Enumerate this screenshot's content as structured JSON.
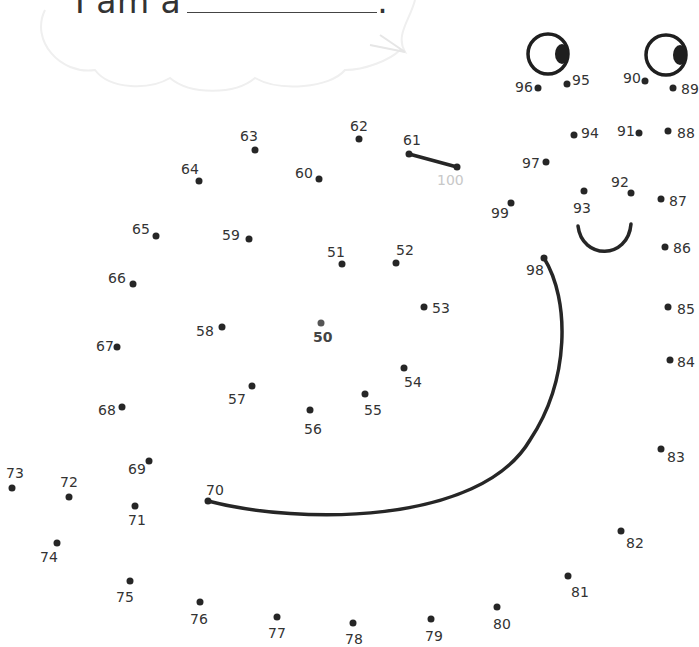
{
  "worksheet": {
    "prompt_text": "I am a",
    "prompt_end": ".",
    "start_label": "50",
    "end_label": "100",
    "colors": {
      "ink": "#262626",
      "label": "#333333",
      "end_label": "#c8c8c8",
      "bubble": "#f2f2f2"
    }
  },
  "dots": [
    {
      "n": "50",
      "x": 321,
      "y": 323,
      "lx": 313,
      "ly": 330,
      "cls": "start"
    },
    {
      "n": "51",
      "x": 342,
      "y": 264,
      "lx": 327,
      "ly": 245
    },
    {
      "n": "52",
      "x": 396,
      "y": 263,
      "lx": 396,
      "ly": 243
    },
    {
      "n": "53",
      "x": 424,
      "y": 307,
      "lx": 432,
      "ly": 301
    },
    {
      "n": "54",
      "x": 404,
      "y": 368,
      "lx": 404,
      "ly": 375
    },
    {
      "n": "55",
      "x": 365,
      "y": 394,
      "lx": 364,
      "ly": 403
    },
    {
      "n": "56",
      "x": 310,
      "y": 410,
      "lx": 304,
      "ly": 422
    },
    {
      "n": "57",
      "x": 252,
      "y": 386,
      "lx": 228,
      "ly": 392
    },
    {
      "n": "58",
      "x": 222,
      "y": 327,
      "lx": 196,
      "ly": 324
    },
    {
      "n": "59",
      "x": 249,
      "y": 239,
      "lx": 222,
      "ly": 228
    },
    {
      "n": "60",
      "x": 319,
      "y": 179,
      "lx": 295,
      "ly": 166
    },
    {
      "n": "61",
      "x": 409,
      "y": 154,
      "lx": 403,
      "ly": 133
    },
    {
      "n": "62",
      "x": 359,
      "y": 139,
      "lx": 350,
      "ly": 119
    },
    {
      "n": "63",
      "x": 255,
      "y": 150,
      "lx": 240,
      "ly": 129
    },
    {
      "n": "64",
      "x": 199,
      "y": 181,
      "lx": 181,
      "ly": 162
    },
    {
      "n": "65",
      "x": 156,
      "y": 236,
      "lx": 132,
      "ly": 222
    },
    {
      "n": "66",
      "x": 133,
      "y": 284,
      "lx": 108,
      "ly": 271
    },
    {
      "n": "67",
      "x": 117,
      "y": 347,
      "lx": 96,
      "ly": 339
    },
    {
      "n": "68",
      "x": 122,
      "y": 407,
      "lx": 98,
      "ly": 403
    },
    {
      "n": "69",
      "x": 149,
      "y": 461,
      "lx": 128,
      "ly": 462
    },
    {
      "n": "70",
      "x": 208,
      "y": 501,
      "lx": 206,
      "ly": 483
    },
    {
      "n": "71",
      "x": 135,
      "y": 506,
      "lx": 128,
      "ly": 513
    },
    {
      "n": "72",
      "x": 69,
      "y": 497,
      "lx": 60,
      "ly": 475
    },
    {
      "n": "73",
      "x": 12,
      "y": 488,
      "lx": 6,
      "ly": 466
    },
    {
      "n": "74",
      "x": 57,
      "y": 543,
      "lx": 40,
      "ly": 550
    },
    {
      "n": "75",
      "x": 130,
      "y": 581,
      "lx": 116,
      "ly": 590
    },
    {
      "n": "76",
      "x": 200,
      "y": 602,
      "lx": 190,
      "ly": 612
    },
    {
      "n": "77",
      "x": 277,
      "y": 617,
      "lx": 268,
      "ly": 626
    },
    {
      "n": "78",
      "x": 353,
      "y": 623,
      "lx": 345,
      "ly": 632
    },
    {
      "n": "79",
      "x": 431,
      "y": 619,
      "lx": 425,
      "ly": 629
    },
    {
      "n": "80",
      "x": 497,
      "y": 607,
      "lx": 493,
      "ly": 617
    },
    {
      "n": "81",
      "x": 568,
      "y": 576,
      "lx": 571,
      "ly": 585
    },
    {
      "n": "82",
      "x": 621,
      "y": 531,
      "lx": 626,
      "ly": 536
    },
    {
      "n": "83",
      "x": 661,
      "y": 449,
      "lx": 667,
      "ly": 450
    },
    {
      "n": "84",
      "x": 670,
      "y": 360,
      "lx": 677,
      "ly": 355
    },
    {
      "n": "85",
      "x": 668,
      "y": 307,
      "lx": 677,
      "ly": 302
    },
    {
      "n": "86",
      "x": 665,
      "y": 247,
      "lx": 673,
      "ly": 241
    },
    {
      "n": "87",
      "x": 661,
      "y": 199,
      "lx": 669,
      "ly": 194
    },
    {
      "n": "88",
      "x": 668,
      "y": 131,
      "lx": 677,
      "ly": 126
    },
    {
      "n": "89",
      "x": 673,
      "y": 88,
      "lx": 681,
      "ly": 82
    },
    {
      "n": "90",
      "x": 645,
      "y": 81,
      "lx": 623,
      "ly": 71
    },
    {
      "n": "91",
      "x": 639,
      "y": 133,
      "lx": 617,
      "ly": 124
    },
    {
      "n": "92",
      "x": 631,
      "y": 193,
      "lx": 611,
      "ly": 175
    },
    {
      "n": "93",
      "x": 584,
      "y": 191,
      "lx": 573,
      "ly": 201
    },
    {
      "n": "94",
      "x": 574,
      "y": 135,
      "lx": 581,
      "ly": 126
    },
    {
      "n": "95",
      "x": 567,
      "y": 84,
      "lx": 572,
      "ly": 73
    },
    {
      "n": "96",
      "x": 538,
      "y": 88,
      "lx": 515,
      "ly": 80
    },
    {
      "n": "97",
      "x": 546,
      "y": 162,
      "lx": 522,
      "ly": 156
    },
    {
      "n": "98",
      "x": 544,
      "y": 258,
      "lx": 526,
      "ly": 263
    },
    {
      "n": "99",
      "x": 511,
      "y": 203,
      "lx": 491,
      "ly": 206
    },
    {
      "n": "100",
      "x": 457,
      "y": 167,
      "lx": 437,
      "ly": 173,
      "cls": "end"
    }
  ]
}
